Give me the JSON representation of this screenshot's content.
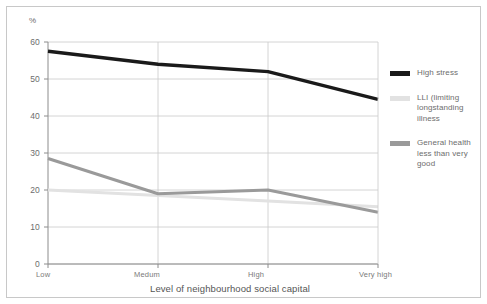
{
  "chart_data": {
    "type": "line",
    "title": "",
    "xlabel": "Level of neighbourhood social capital",
    "ylabel": "%",
    "categories": [
      "Low",
      "Medum",
      "High",
      "Very high"
    ],
    "ylim": [
      0,
      60
    ],
    "yticks": [
      0,
      10,
      20,
      30,
      40,
      50,
      60
    ],
    "grid": true,
    "legend_position": "right",
    "series": [
      {
        "name": "High stress",
        "color": "#1a1a1a",
        "values": [
          57.5,
          54.0,
          52.0,
          44.5
        ]
      },
      {
        "name": "LLI (limiting longstanding illness",
        "color": "#e2e2e2",
        "values": [
          20.0,
          18.5,
          17.0,
          15.5
        ]
      },
      {
        "name": "General health less than very good",
        "color": "#9a9a9a",
        "values": [
          28.5,
          19.0,
          20.0,
          14.0
        ]
      }
    ]
  },
  "axes": {
    "y_unit_label": "%",
    "y_tick_labels": [
      "60",
      "50",
      "40",
      "30",
      "20",
      "10",
      "0"
    ],
    "x_tick_labels": [
      "Low",
      "Medum",
      "High",
      "Very high"
    ],
    "x_axis_title": "Level of neighbourhood social capital"
  },
  "legend": {
    "items": [
      {
        "label": "High stress",
        "color": "#1a1a1a"
      },
      {
        "label": "LLI (limiting longstanding illness",
        "color": "#e2e2e2"
      },
      {
        "label": "General health less than very good",
        "color": "#9a9a9a"
      }
    ]
  },
  "colors": {
    "frame": "#c8c8c8",
    "grid": "#c9c9c9",
    "axis": "#8c8c8c",
    "tick_text": "#6d6d6d",
    "background": "#ffffff"
  }
}
